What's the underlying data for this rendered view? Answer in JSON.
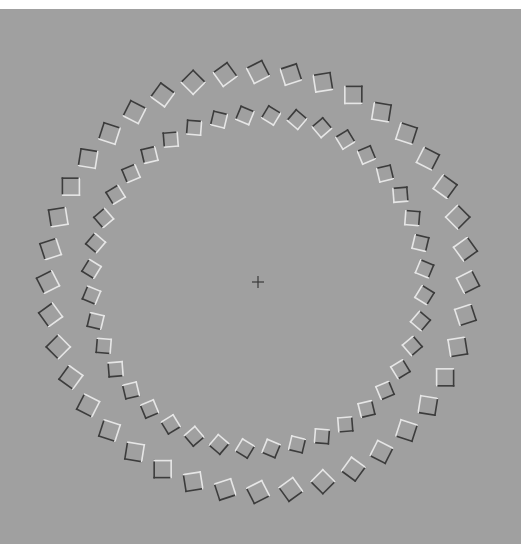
{
  "figure": {
    "title": "",
    "type": "optical-illusion-rotating-rings",
    "background_color": "#a0a0a0",
    "page_color": "#ffffff",
    "center": {
      "x": 258,
      "y": 282
    },
    "fixation_cross": {
      "size": 12,
      "color": "#3a3a3a",
      "stroke_width": 1.2
    },
    "dark_edge_color": "#3c3c3c",
    "light_edge_color": "#e6e6e6",
    "rings": [
      {
        "name": "outer-ring",
        "radius": 210,
        "count": 40,
        "square_size": 17,
        "tilt_deg": 18,
        "angle_offset_deg": 0
      },
      {
        "name": "inner-ring",
        "radius": 167,
        "count": 40,
        "square_size": 14,
        "tilt_deg": -18,
        "angle_offset_deg": 4.5
      }
    ]
  }
}
